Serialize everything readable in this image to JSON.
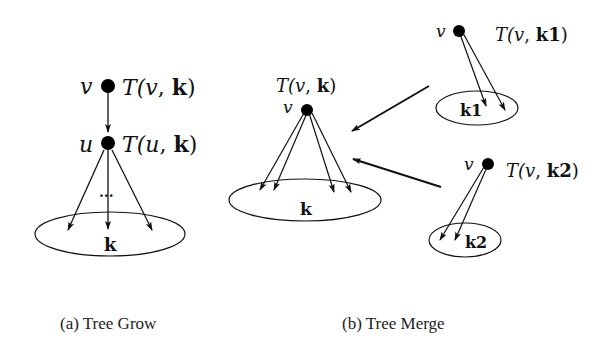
{
  "figure": {
    "panel_a": {
      "caption": "(a) Tree Grow",
      "top_node": {
        "name": "v",
        "label_T": "T(",
        "label_var": "v",
        "label_sep": ", ",
        "label_set": "k",
        "label_close": ")"
      },
      "mid_node": {
        "name": "u",
        "label_T": "T(",
        "label_var": "u",
        "label_sep": ", ",
        "label_set": "k",
        "label_close": ")"
      },
      "ellipsis": "...",
      "set_label": "k"
    },
    "panel_b": {
      "caption": "(b) Tree Merge",
      "merged_tree": {
        "name": "v",
        "label_T": "T(",
        "label_var": "v",
        "label_sep": ", ",
        "label_set": "k",
        "label_close": ")",
        "set_label": "k"
      },
      "subtree_1": {
        "name": "v",
        "label_T": "T(",
        "label_var": "v",
        "label_sep": ", ",
        "label_set": "k1",
        "label_close": ")",
        "set_label": "k1"
      },
      "subtree_2": {
        "name": "v",
        "label_T": "T(",
        "label_var": "v",
        "label_sep": ", ",
        "label_set": "k2",
        "label_close": ")",
        "set_label": "k2"
      }
    }
  }
}
